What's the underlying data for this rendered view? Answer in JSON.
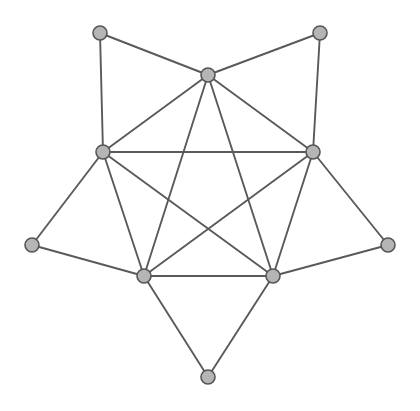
{
  "figure": {
    "background_color": "#ffffff",
    "width": 420,
    "height": 411
  },
  "style": {
    "node_fill": "#b5b5b5",
    "node_stroke": "#555555",
    "node_radius": 7,
    "node_stroke_width": 1.6,
    "edge_color": "#5a5a5a",
    "edge_width": 1.9
  },
  "chart_data": {
    "type": "graph",
    "node_count": 10,
    "edge_count": 20,
    "nodes": [
      {
        "id": "top-center",
        "label": "",
        "x": 208,
        "y": 75,
        "degree": 6,
        "ring": "inner"
      },
      {
        "id": "left-mid",
        "label": "",
        "x": 103,
        "y": 152,
        "degree": 6,
        "ring": "inner"
      },
      {
        "id": "right-mid",
        "label": "",
        "x": 313,
        "y": 152,
        "degree": 6,
        "ring": "inner"
      },
      {
        "id": "bottom-left",
        "label": "",
        "x": 144,
        "y": 276,
        "degree": 6,
        "ring": "inner"
      },
      {
        "id": "bottom-right",
        "label": "",
        "x": 273,
        "y": 276,
        "degree": 6,
        "ring": "inner"
      },
      {
        "id": "outer-top-left",
        "label": "",
        "x": 100,
        "y": 33,
        "degree": 2,
        "ring": "outer"
      },
      {
        "id": "outer-top-right",
        "label": "",
        "x": 320,
        "y": 33,
        "degree": 2,
        "ring": "outer"
      },
      {
        "id": "outer-left",
        "label": "",
        "x": 32,
        "y": 245,
        "degree": 2,
        "ring": "outer"
      },
      {
        "id": "outer-right",
        "label": "",
        "x": 388,
        "y": 245,
        "degree": 2,
        "ring": "outer"
      },
      {
        "id": "outer-bottom",
        "label": "",
        "x": 208,
        "y": 377,
        "degree": 2,
        "ring": "outer"
      }
    ],
    "edges": [
      {
        "source": "top-center",
        "target": "left-mid",
        "kind": "pentagon-side"
      },
      {
        "source": "top-center",
        "target": "right-mid",
        "kind": "pentagon-side"
      },
      {
        "source": "left-mid",
        "target": "bottom-left",
        "kind": "pentagon-side"
      },
      {
        "source": "right-mid",
        "target": "bottom-right",
        "kind": "pentagon-side"
      },
      {
        "source": "bottom-left",
        "target": "bottom-right",
        "kind": "pentagon-side"
      },
      {
        "source": "left-mid",
        "target": "right-mid",
        "kind": "pentagram-chord"
      },
      {
        "source": "top-center",
        "target": "bottom-left",
        "kind": "pentagram-chord"
      },
      {
        "source": "top-center",
        "target": "bottom-right",
        "kind": "pentagram-chord"
      },
      {
        "source": "left-mid",
        "target": "bottom-right",
        "kind": "pentagram-chord"
      },
      {
        "source": "right-mid",
        "target": "bottom-left",
        "kind": "pentagram-chord"
      },
      {
        "source": "outer-top-left",
        "target": "left-mid",
        "kind": "spoke"
      },
      {
        "source": "outer-top-left",
        "target": "top-center",
        "kind": "spoke"
      },
      {
        "source": "outer-top-right",
        "target": "top-center",
        "kind": "spoke"
      },
      {
        "source": "outer-top-right",
        "target": "right-mid",
        "kind": "spoke"
      },
      {
        "source": "outer-left",
        "target": "left-mid",
        "kind": "spoke"
      },
      {
        "source": "outer-left",
        "target": "bottom-left",
        "kind": "spoke"
      },
      {
        "source": "outer-right",
        "target": "right-mid",
        "kind": "spoke"
      },
      {
        "source": "outer-right",
        "target": "bottom-right",
        "kind": "spoke"
      },
      {
        "source": "outer-bottom",
        "target": "bottom-left",
        "kind": "spoke"
      },
      {
        "source": "outer-bottom",
        "target": "bottom-right",
        "kind": "spoke"
      }
    ],
    "xlabel": "",
    "ylabel": "",
    "legend": [],
    "annotations": [],
    "grid": false
  }
}
